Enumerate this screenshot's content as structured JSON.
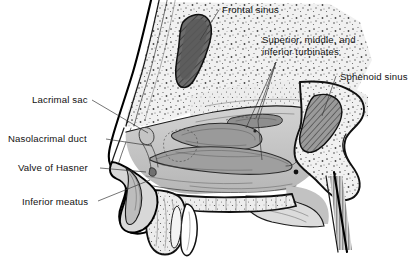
{
  "figure": {
    "background_color": "#ffffff",
    "ink_color": "#000000",
    "width": 412,
    "height": 257
  },
  "labels": {
    "frontal_sinus": "Frontal sinus",
    "turbinates_line1": "Superior, middle, and",
    "turbinates_line2": "inferior turbinates",
    "sphenoid_sinus": "Sphenoid sinus",
    "lacrimal_sac": "Lacrimal sac",
    "nasolacrimal_duct": "Nasolacrimal duct",
    "valve_of_hasner": "Valve of Hasner",
    "inferior_meatus": "Inferior meatus"
  },
  "structures": {
    "frontal_sinus_fill": "#6e6e6e",
    "sphenoid_sinus_fill": "#8a8a8a",
    "bone_fill": "#efefef",
    "soft_tissue_fill": "#c9c9c9",
    "mucosa_fill": "#b4b4b4",
    "tooth_fill": "#ffffff",
    "palate_fill": "#e2e2e2"
  },
  "leader_lines": [
    {
      "name": "frontal-sinus-leader",
      "from": "label",
      "to": "frontal sinus cavity"
    },
    {
      "name": "turbinates-leader-superior",
      "from": "label",
      "to": "superior turbinate"
    },
    {
      "name": "turbinates-leader-middle",
      "from": "label",
      "to": "middle turbinate"
    },
    {
      "name": "turbinates-leader-inferior",
      "from": "label",
      "to": "inferior turbinate"
    },
    {
      "name": "sphenoid-sinus-leader",
      "from": "label",
      "to": "sphenoid sinus cavity"
    },
    {
      "name": "lacrimal-sac-leader",
      "from": "label",
      "to": "lacrimal sac"
    },
    {
      "name": "nasolacrimal-duct-leader",
      "from": "label",
      "to": "nasolacrimal duct"
    },
    {
      "name": "valve-of-hasner-leader",
      "from": "label",
      "to": "valve of Hasner"
    },
    {
      "name": "inferior-meatus-leader",
      "from": "label",
      "to": "inferior meatus"
    }
  ]
}
